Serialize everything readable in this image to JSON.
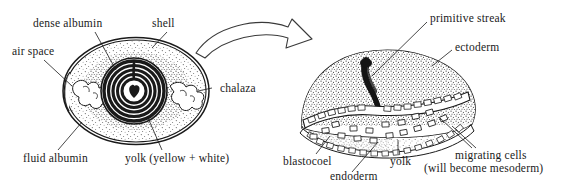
{
  "figure": {
    "background_color": "#ffffff",
    "ink_color": "#1a1a1a"
  },
  "left_diagram": {
    "name": "egg-cross-section",
    "labels": [
      {
        "id": "dense-albumin",
        "text": "dense albumin"
      },
      {
        "id": "shell",
        "text": "shell"
      },
      {
        "id": "air-space",
        "text": "air space"
      },
      {
        "id": "chalaza",
        "text": "chalaza"
      },
      {
        "id": "fluid-albumin",
        "text": "fluid albumin"
      },
      {
        "id": "yolk",
        "text": "yolk (yellow + white)"
      }
    ]
  },
  "transition": {
    "name": "curved-arrow",
    "direction": "left-to-right"
  },
  "right_diagram": {
    "name": "blastoderm-cross-section",
    "labels": [
      {
        "id": "primitive-streak",
        "text": "primitive streak"
      },
      {
        "id": "ectoderm",
        "text": "ectoderm"
      },
      {
        "id": "blastocoel",
        "text": "blastocoel"
      },
      {
        "id": "endoderm",
        "text": "endoderm"
      },
      {
        "id": "yolk",
        "text": "yolk"
      },
      {
        "id": "migrating-cells-1",
        "text": "migrating cells"
      },
      {
        "id": "migrating-cells-2",
        "text": "(will become mesoderm)"
      }
    ]
  }
}
